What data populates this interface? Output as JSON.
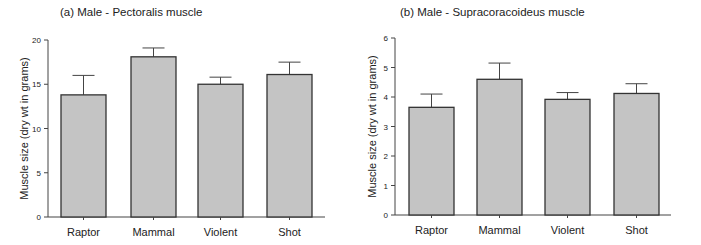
{
  "chart_data": [
    {
      "type": "bar",
      "title": "(a) Male - Pectoralis muscle",
      "xlabel": "",
      "ylabel": "Muscle size (dry wt in grams)",
      "categories": [
        "Raptor",
        "Mammal",
        "Violent",
        "Shot"
      ],
      "values": [
        13.8,
        18.1,
        15.0,
        16.1
      ],
      "error_upper": [
        16.0,
        19.1,
        15.8,
        17.5
      ],
      "ylim": [
        0,
        20
      ],
      "yticks": [
        0,
        5,
        10,
        15,
        20
      ],
      "grid": false,
      "legend": null,
      "bar_color": "#c4c4c4",
      "edge_color": "#333333"
    },
    {
      "type": "bar",
      "title": "(b) Male - Supracoracoideus muscle",
      "xlabel": "",
      "ylabel": "Muscle size (dry wt in grams)",
      "categories": [
        "Raptor",
        "Mammal",
        "Violent",
        "Shot"
      ],
      "values": [
        3.65,
        4.6,
        3.92,
        4.12
      ],
      "error_upper": [
        4.1,
        5.15,
        4.15,
        4.45
      ],
      "ylim": [
        0,
        6
      ],
      "yticks": [
        0,
        1,
        2,
        3,
        4,
        5,
        6
      ],
      "grid": false,
      "legend": null,
      "bar_color": "#c4c4c4",
      "edge_color": "#333333"
    }
  ]
}
